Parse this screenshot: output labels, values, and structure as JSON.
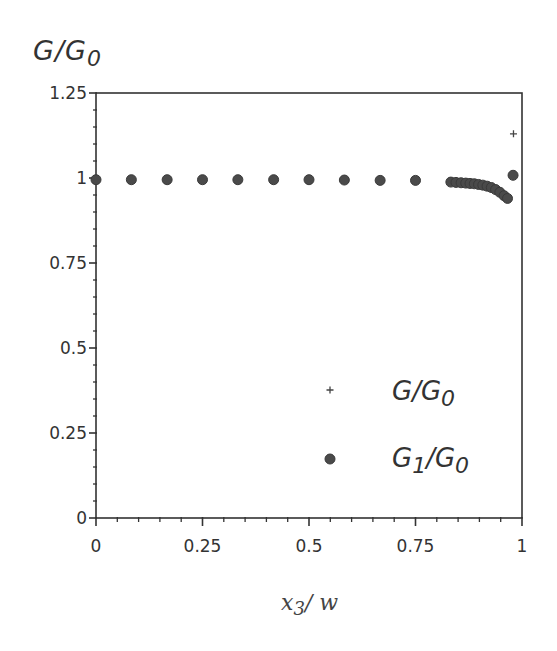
{
  "chart_data": {
    "type": "scatter",
    "title": "",
    "ylabel": "G/G0",
    "xlabel": "x3/w",
    "xlim": [
      0,
      1
    ],
    "ylim": [
      0,
      1.25
    ],
    "x_ticks": [
      0,
      0.25,
      0.5,
      0.75,
      1
    ],
    "x_tick_labels": [
      "0",
      "0.25",
      "0.5",
      "0.75",
      "1"
    ],
    "y_ticks": [
      0,
      0.25,
      0.5,
      0.75,
      1,
      1.25
    ],
    "y_tick_labels": [
      "0",
      "0.25",
      "0.5",
      "0.75",
      "1",
      "1.25"
    ],
    "minor_ticks_per_major": 4,
    "grid": false,
    "legend_position": "lower right (inside)",
    "series": [
      {
        "name": "G/G0",
        "marker": "plus",
        "points": [
          {
            "x": 0.98,
            "y": 1.13
          }
        ]
      },
      {
        "name": "G1/G0",
        "marker": "diamond",
        "points": [
          {
            "x": 0.0,
            "y": 0.995
          },
          {
            "x": 0.083,
            "y": 0.995
          },
          {
            "x": 0.167,
            "y": 0.995
          },
          {
            "x": 0.25,
            "y": 0.995
          },
          {
            "x": 0.333,
            "y": 0.995
          },
          {
            "x": 0.417,
            "y": 0.995
          },
          {
            "x": 0.5,
            "y": 0.995
          },
          {
            "x": 0.583,
            "y": 0.994
          },
          {
            "x": 0.667,
            "y": 0.993
          },
          {
            "x": 0.75,
            "y": 0.993
          },
          {
            "x": 0.833,
            "y": 0.988
          },
          {
            "x": 0.845,
            "y": 0.987
          },
          {
            "x": 0.857,
            "y": 0.986
          },
          {
            "x": 0.868,
            "y": 0.985
          },
          {
            "x": 0.878,
            "y": 0.984
          },
          {
            "x": 0.888,
            "y": 0.983
          },
          {
            "x": 0.898,
            "y": 0.981
          },
          {
            "x": 0.908,
            "y": 0.979
          },
          {
            "x": 0.918,
            "y": 0.976
          },
          {
            "x": 0.928,
            "y": 0.972
          },
          {
            "x": 0.938,
            "y": 0.966
          },
          {
            "x": 0.948,
            "y": 0.958
          },
          {
            "x": 0.958,
            "y": 0.948
          },
          {
            "x": 0.966,
            "y": 0.94
          },
          {
            "x": 0.979,
            "y": 1.008
          }
        ]
      }
    ]
  },
  "labels": {
    "y_title_main": "G/G",
    "y_title_sub": "0",
    "x_title_main": "x",
    "x_title_sub": "3",
    "x_title_rest": "/ w",
    "legend": [
      {
        "symbol": "+",
        "main": "G/G",
        "sub": "0",
        "pre_sub": ""
      },
      {
        "symbol": "◆",
        "main": "G",
        "sub": "1",
        "rest": "/G",
        "sub2": "0"
      }
    ]
  }
}
